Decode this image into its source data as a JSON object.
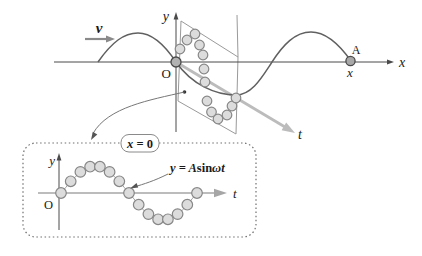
{
  "labels": {
    "velocity": "v",
    "main_y_axis": "y",
    "main_origin": "O",
    "main_x_axis": "x",
    "point_a": "A",
    "point_a_x": "x",
    "main_t_axis": "t",
    "inset_y_axis": "y",
    "inset_origin": "O",
    "inset_t_axis": "t",
    "inset_condition": {
      "var": "x",
      "rest": " = 0"
    },
    "inset_equation": {
      "pre": "y = A",
      "fn": "sin",
      "arg": "ωt"
    }
  },
  "colors": {
    "background": "#ffffff",
    "wave_curve": "#606060",
    "axis": "#4a4a4a",
    "time_axis": "#bcbcbc",
    "inset_time_axis": "#a6a6a6",
    "plane_stroke": "#9a9a9a",
    "bead_fill": "#dcdcdc",
    "bead_stroke": "#878787",
    "origin_bead_fill": "#b2b2b2",
    "origin_bead_stroke": "#4a4a4a",
    "callout": "#777777",
    "inset_border": "#6f6f6f",
    "text": "#1a1a1a"
  },
  "geometry": {
    "main_wave_path": "M98,62 C112,42 124,33 138,33 C152,33 164,44 176,62 C192,85 216,95 236,95 C252,95 262,77 272,62 C283,45 295,32 311,32 C325,32 339,44 351,61",
    "inset_wave_path": "M61,193 C73,179 83,166 95,166 C107,166 117,179 129,193 C141,207 149,220 163,220 C177,220 185,207 197,193",
    "plane_polygon": "181,21 238,57 236,134 178,101",
    "main_beads": [
      [
        180,
        49
      ],
      [
        187,
        40
      ],
      [
        195,
        34
      ],
      [
        199.5,
        45
      ],
      [
        203,
        55
      ],
      [
        204,
        69
      ],
      [
        205,
        82
      ],
      [
        207,
        101
      ],
      [
        211.5,
        112
      ],
      [
        218,
        119
      ],
      [
        227,
        115
      ],
      [
        232,
        106
      ],
      [
        236,
        98
      ]
    ],
    "inset_beads": [
      [
        61,
        193
      ],
      [
        70.7,
        181.3
      ],
      [
        80.4,
        171.9
      ],
      [
        90.1,
        166.7
      ],
      [
        99.9,
        166.7
      ],
      [
        109.6,
        171.9
      ],
      [
        119.3,
        181.3
      ],
      [
        129,
        193
      ],
      [
        138.7,
        204.7
      ],
      [
        148.4,
        214.1
      ],
      [
        158.1,
        219.3
      ],
      [
        167.9,
        219.3
      ],
      [
        177.6,
        214.1
      ],
      [
        187.3,
        204.7
      ],
      [
        197,
        193
      ]
    ],
    "bead_radius_main": 4.8,
    "bead_radius_inset": 5.3
  }
}
